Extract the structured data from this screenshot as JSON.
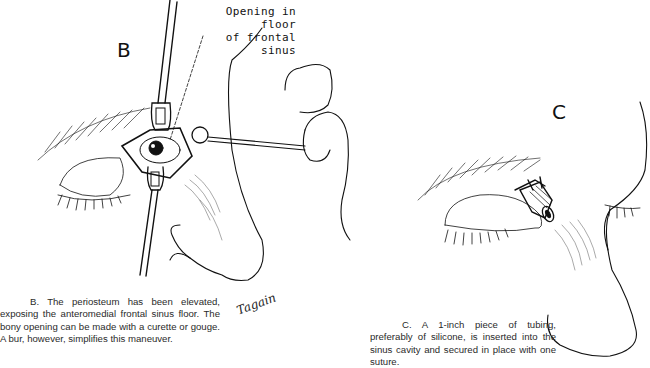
{
  "figure": {
    "panel_b": {
      "letter": "B",
      "callout_line1": "Opening in floor",
      "callout_line2": "of frontal sinus",
      "caption": "B.  The periosteum has been elevated, exposing the anteromedial frontal sinus floor. The bony opening can be made with a curette or gouge. A bur, however, simplifies this maneuver."
    },
    "panel_c": {
      "letter": "C",
      "caption": "C.  A 1-inch piece of tubing, preferably of silicone, is inserted into the sinus cavity and secured in place with one suture."
    },
    "signature": "Tagain",
    "colors": {
      "ink": "#111111",
      "background": "#ffffff",
      "caption_text": "#2a2a2a"
    }
  }
}
